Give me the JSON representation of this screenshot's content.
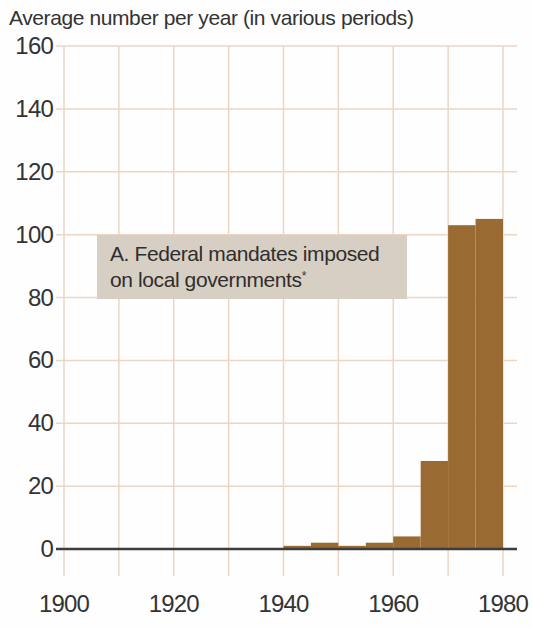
{
  "figure": {
    "title": "Average number per year (in various periods)"
  },
  "chart_data": {
    "type": "bar",
    "title": "Average number per year (in various periods)",
    "annotation": {
      "line1": "A. Federal mandates imposed",
      "line2": "on local governments",
      "footnote_marker": "*"
    },
    "x_axis": {
      "range": [
        1900,
        1980
      ],
      "gridline_step": 10,
      "ticks": [
        1900,
        1920,
        1940,
        1960,
        1980
      ]
    },
    "y_axis": {
      "range": [
        0,
        160
      ],
      "gridline_step": 20,
      "ticks": [
        0,
        20,
        40,
        60,
        80,
        100,
        120,
        140,
        160
      ]
    },
    "grid": true,
    "legend": false,
    "bars": [
      {
        "period": "1940-1945",
        "start": 1940,
        "end": 1945,
        "value": 1
      },
      {
        "period": "1945-1950",
        "start": 1945,
        "end": 1950,
        "value": 2
      },
      {
        "period": "1950-1955",
        "start": 1950,
        "end": 1955,
        "value": 1
      },
      {
        "period": "1955-1960",
        "start": 1955,
        "end": 1960,
        "value": 2
      },
      {
        "period": "1960-1965",
        "start": 1960,
        "end": 1965,
        "value": 4
      },
      {
        "period": "1965-1970",
        "start": 1965,
        "end": 1970,
        "value": 28
      },
      {
        "period": "1970-1975",
        "start": 1970,
        "end": 1975,
        "value": 103
      },
      {
        "period": "1975-1980",
        "start": 1975,
        "end": 1980,
        "value": 105
      }
    ],
    "colors": {
      "bar": "#9a6a33",
      "gridline": "#ecd5c3",
      "axis_line": "#3d3d3d",
      "text": "#333333",
      "annotation_bg": "#d8cfc4",
      "background": "#fefefe"
    }
  }
}
